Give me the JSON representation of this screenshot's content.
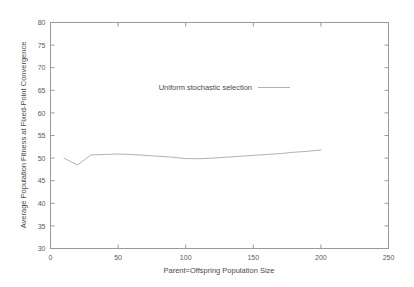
{
  "chart_data": {
    "type": "line",
    "title": "",
    "xlabel": "Parent=Offspring Population Size",
    "ylabel": "Average Population Fitness at Fixed-Point Convergence",
    "xlim": [
      0,
      250
    ],
    "ylim": [
      30,
      80
    ],
    "xticks": [
      0,
      50,
      100,
      150,
      200,
      250
    ],
    "yticks": [
      30,
      35,
      40,
      45,
      50,
      55,
      60,
      65,
      70,
      75,
      80
    ],
    "xtick_labels": [
      "0",
      "50",
      "100",
      "150",
      "200",
      "250"
    ],
    "ytick_labels": [
      "30",
      "35",
      "40",
      "45",
      "50",
      "55",
      "60",
      "65",
      "70",
      "75",
      "80"
    ],
    "grid": false,
    "legend_position": "inside-top-center",
    "series": [
      {
        "name": "Uniform stochastic selection",
        "color": "#a8a8a8",
        "x": [
          10,
          15,
          20,
          25,
          30,
          40,
          50,
          60,
          70,
          80,
          90,
          100,
          110,
          120,
          130,
          140,
          150,
          160,
          170,
          180,
          190,
          200
        ],
        "values": [
          50.0,
          49.2,
          48.5,
          49.6,
          50.7,
          50.8,
          50.9,
          50.8,
          50.6,
          50.4,
          50.2,
          49.9,
          49.85,
          50.0,
          50.2,
          50.4,
          50.6,
          50.8,
          51.0,
          51.3,
          51.5,
          51.8
        ]
      }
    ]
  },
  "legend": {
    "entries": [
      {
        "label": "Uniform stochastic selection"
      }
    ]
  },
  "axes": {
    "x_title": "Parent=Offspring Population Size",
    "y_title": "Average Population Fitness at Fixed-Point Convergence"
  }
}
